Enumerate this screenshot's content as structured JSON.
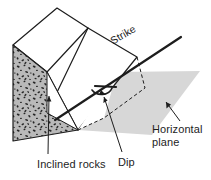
{
  "diagram": {
    "labels": {
      "strike": "Strike",
      "horizontal_plane_line1": "Horizontal",
      "horizontal_plane_line2": "plane",
      "inclined_rocks": "Inclined rocks",
      "dip": "Dip"
    },
    "colors": {
      "background": "#ffffff",
      "outline": "#1d1d1d",
      "rock_face_fill": "#b9b9b9",
      "speckle": "#2e2e2e",
      "horizontal_plane_fill": "#d7d7d7",
      "block_top_fill": "#ffffff",
      "block_bedding_fill": "#ffffff",
      "text": "#1d1d1d"
    },
    "elements": {
      "block_top_face": "block-top-face",
      "block_front_rock_face": "speckled-rock-face",
      "block_bedding_plane": "inclined-bedding-plane",
      "horizontal_plane": "horizontal-reference-plane",
      "strike_line": "strike-line",
      "dip_arc": "dip-angle-arc",
      "dip_arrow": "dip-direction-arrow",
      "dashed_outline": "dashed-projection-line"
    }
  }
}
